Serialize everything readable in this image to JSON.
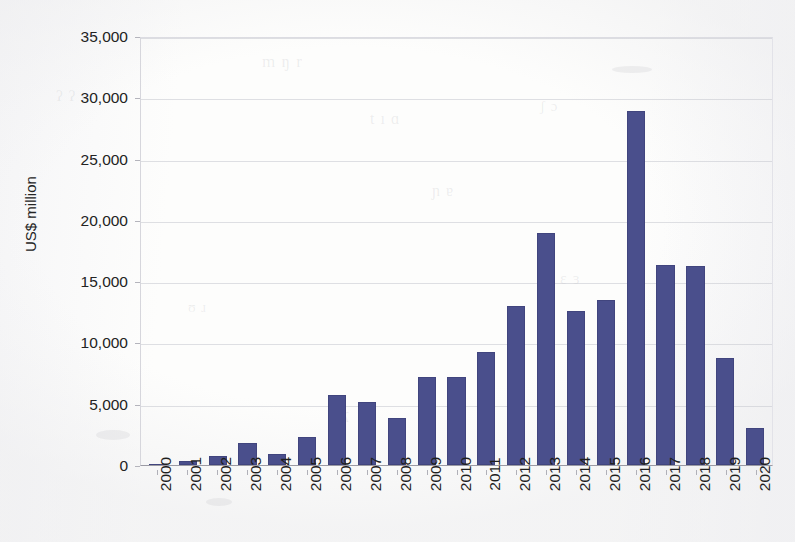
{
  "chart_data": {
    "type": "bar",
    "title": "",
    "subtitle": "",
    "xlabel": "",
    "ylabel": "US$ million",
    "ylim": [
      0,
      35000
    ],
    "ytick_step": 5000,
    "ytick_labels": [
      "35,000",
      "30,000",
      "25,000",
      "20,000",
      "15,000",
      "10,000",
      "5,000",
      "0"
    ],
    "ytick_values": [
      35000,
      30000,
      25000,
      20000,
      15000,
      10000,
      5000,
      0
    ],
    "grid": true,
    "legend": "none",
    "bar_color": "#4a4f8c",
    "categories": [
      "2000",
      "2001",
      "2002",
      "2003",
      "2004",
      "2005",
      "2006",
      "2007",
      "2008",
      "2009",
      "2010",
      "2011",
      "2012",
      "2013",
      "2014",
      "2015",
      "2016",
      "2017",
      "2018",
      "2019",
      "2020"
    ],
    "values": [
      100,
      300,
      700,
      1800,
      900,
      2300,
      5700,
      5150,
      3850,
      7200,
      7200,
      9200,
      12950,
      18900,
      12600,
      13500,
      28900,
      16350,
      16250,
      8750,
      3000
    ]
  }
}
